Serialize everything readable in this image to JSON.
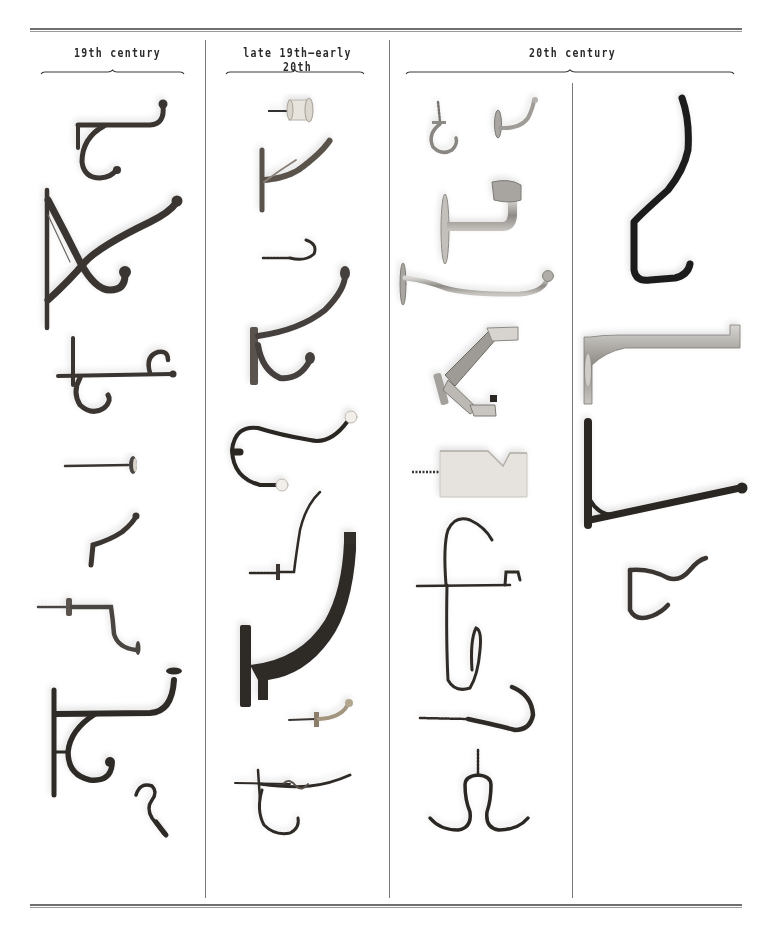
{
  "figure": {
    "columns": [
      {
        "label": "19th century"
      },
      {
        "label": "late 19th–early 20th"
      },
      {
        "label": "20th century"
      }
    ],
    "colors": {
      "rule": "#6f6f6f",
      "text": "#2a2a2a",
      "cast_iron": "#3b3633",
      "dark_iron": "#2b2624",
      "brass": "#8a7d6a",
      "chrome": "#b9b6b1",
      "chrome_dark": "#7d7a76",
      "porcelain": "#efece6",
      "background": "#ffffff"
    },
    "items": {
      "col1": [
        "double cast-iron coat hook",
        "ornate cast-iron bracket hook",
        "spike-mounted scroll hook",
        "porcelain-head nail",
        "small S-hook",
        "screw-in angled hook",
        "large cast-iron double hook",
        "small twisted hook"
      ],
      "col2": [
        "porcelain spool knob",
        "rustic cast hook",
        "cup hook",
        "double coat hook",
        "wire hook with porcelain ends",
        "screw-in wire hook",
        "large curved cast hook",
        "small brass ball hook",
        "twisted wire double hook"
      ],
      "col3": [
        "chrome cup hook",
        "chrome wall hook",
        "chrome handrail bracket",
        "long chrome ball hook",
        "chrome folding hat-and-coat hook",
        "aluminium block hook",
        "wire multi-hook",
        "screw-in J hook",
        "double S wire hook"
      ],
      "col4": [
        "large black hook",
        "aluminium bracket arm",
        "cast-iron L bracket",
        "small cast double hook"
      ]
    }
  }
}
